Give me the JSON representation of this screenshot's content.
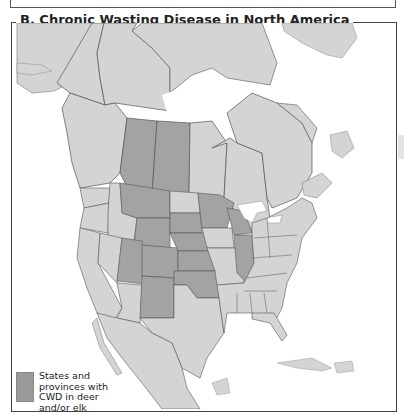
{
  "figure": {
    "title": "B. Chronic Wasting Disease in North America"
  },
  "map": {
    "region": "North America",
    "colors": {
      "water": "#ffffff",
      "land": "#d4d4d4",
      "cwd_affected": "#a3a3a3",
      "borders": "#555555"
    },
    "affected_regions": [
      "Alberta",
      "Saskatchewan",
      "Montana",
      "Wyoming",
      "South Dakota",
      "Nebraska",
      "Kansas",
      "Colorado",
      "Utah",
      "New Mexico",
      "Oklahoma",
      "Minnesota",
      "Wisconsin",
      "Illinois"
    ]
  },
  "legend": {
    "items": [
      {
        "label": "States and provinces with CWD in deer and/or elk",
        "color": "#a3a3a3"
      }
    ]
  }
}
